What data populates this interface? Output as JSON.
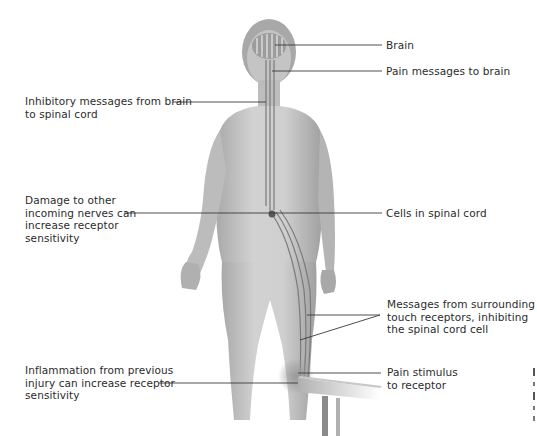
{
  "diagram": {
    "labels": {
      "brain": "Brain",
      "pain_messages": "Pain messages to brain",
      "inhibitory_1": "Inhibitory messages from brain",
      "inhibitory_2": "to spinal cord",
      "damage_1": "Damage to other",
      "damage_2": "incoming nerves can",
      "damage_3": "increase receptor",
      "damage_4": "sensitivity",
      "cells": "Cells in spinal cord",
      "touch_1": "Messages from surrounding",
      "touch_2": "touch receptors, inhibiting",
      "touch_3": "the spinal cord cell",
      "inflammation_1": "Inflammation from previous",
      "inflammation_2": "injury can increase receptor",
      "inflammation_3": "sensitivity",
      "stimulus_1": "Pain stimulus",
      "stimulus_2": "to receptor"
    },
    "colors": {
      "skin_light": "#d9d9d9",
      "skin_mid": "#b8b8b8",
      "skin_dark": "#8f8f8f",
      "nerve": "#7a7a7a",
      "leader_line": "#3a3a3a",
      "text": "#2b2b2b"
    }
  }
}
